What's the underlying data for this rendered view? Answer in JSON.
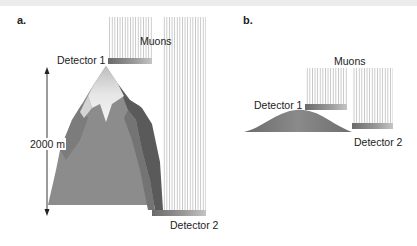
{
  "panel_a": {
    "label": "a.",
    "muons_label": "Muons",
    "detector1_label": "Detector 1",
    "detector2_label": "Detector 2",
    "height_label": "2000 m"
  },
  "panel_b": {
    "label": "b.",
    "muons_label": "Muons",
    "detector1_label": "Detector 1",
    "detector2_label": "Detector 2"
  },
  "colors": {
    "mountain_main": "#8a8a8a",
    "mountain_dark": "#5e5e5e",
    "snow": "#e8e8e8",
    "detector_bar_dark": "#6e6e6e",
    "detector_bar_light": "#bdbdbd",
    "muon_lines": "#c8c8c8",
    "hill": "#7a7a7a",
    "arrow": "#222222"
  }
}
